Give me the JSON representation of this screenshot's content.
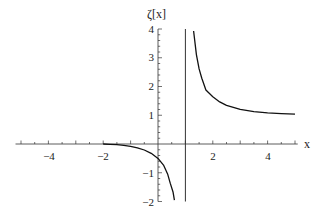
{
  "chart_data": {
    "type": "line",
    "title": "",
    "xlabel": "x",
    "ylabel": "ζ[x]",
    "xlim": [
      -5.2,
      5.1
    ],
    "ylim": [
      -2,
      4
    ],
    "x_ticks": [
      -4,
      -2,
      2,
      4
    ],
    "y_ticks": [
      -2,
      -1,
      1,
      2,
      3,
      4
    ],
    "grid": false,
    "legend": null,
    "annotations": [
      "vertical asymptote at x = 1"
    ],
    "series": [
      {
        "name": "ζ(x) for x < 1",
        "x": [
          -2,
          -1.75,
          -1.5,
          -1.25,
          -1,
          -0.75,
          -0.5,
          -0.25,
          0,
          0.2,
          0.35,
          0.45,
          0.55,
          0.6
        ],
        "values": [
          0,
          -0.014,
          -0.0255,
          -0.046,
          -0.0833,
          -0.135,
          -0.208,
          -0.322,
          -0.5,
          -0.734,
          -1.04,
          -1.37,
          -1.68,
          -1.95
        ]
      },
      {
        "name": "ζ(x) for x > 1",
        "x": [
          1.3,
          1.4,
          1.5,
          1.6,
          1.75,
          2,
          2.25,
          2.5,
          3,
          3.5,
          4,
          4.5,
          5
        ],
        "values": [
          3.93,
          3.11,
          2.612,
          2.286,
          1.88,
          1.645,
          1.464,
          1.341,
          1.202,
          1.127,
          1.082,
          1.055,
          1.037
        ]
      }
    ]
  },
  "labels": {
    "x_axis": "x",
    "y_axis": "ζ[x]",
    "x_tick_neg4": "−4",
    "x_tick_neg2": "−2",
    "x_tick_2": "2",
    "x_tick_4": "4",
    "y_tick_4": "4",
    "y_tick_3": "3",
    "y_tick_2": "2",
    "y_tick_1": "1",
    "y_tick_neg1": "−1",
    "y_tick_neg2": "−2"
  }
}
